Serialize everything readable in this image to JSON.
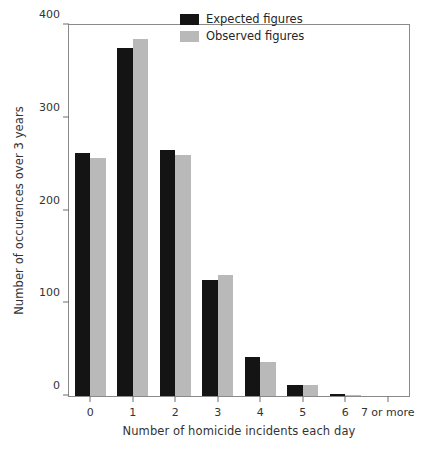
{
  "chart_data": {
    "type": "bar",
    "title": "",
    "xlabel": "Number of homicide incidents each day",
    "ylabel": "Number of occurences over 3 years",
    "categories": [
      "0",
      "1",
      "2",
      "3",
      "4",
      "5",
      "6",
      "7 or more"
    ],
    "series": [
      {
        "name": "Expected figures",
        "color": "#141414",
        "values": [
          262,
          375,
          265,
          125,
          42,
          12,
          2,
          0
        ]
      },
      {
        "name": "Observed figures",
        "color": "#b9b9b9",
        "values": [
          257,
          385,
          260,
          130,
          37,
          12,
          1,
          0
        ]
      }
    ],
    "ylim": [
      0,
      400
    ],
    "yticks": [
      0,
      100,
      200,
      300,
      400
    ],
    "ytick_labels": [
      "0",
      "100",
      "200",
      "300",
      "400"
    ],
    "grid": false,
    "legend_position": "top-right",
    "frame": true
  },
  "legend": {
    "entries": [
      {
        "label": "Expected figures",
        "color": "#141414"
      },
      {
        "label": "Observed figures",
        "color": "#b9b9b9"
      }
    ]
  },
  "colors": {
    "expected": "#141414",
    "observed": "#b9b9b9",
    "axis": "#8a8a8a",
    "text": "#333333",
    "background": "#ffffff"
  }
}
